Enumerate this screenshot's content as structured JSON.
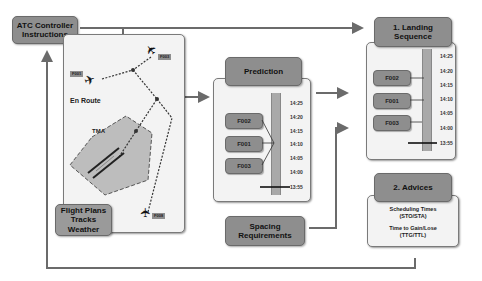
{
  "atc": {
    "line1": "ATC Controller",
    "line2": "Instructions"
  },
  "airspace": {
    "en_route_label": "En Route",
    "tma_label": "TMA",
    "flights": [
      "F001",
      "F003",
      "F008"
    ],
    "data_box": {
      "line1": "Flight Plans",
      "line2": "Tracks",
      "line3": "Weather"
    }
  },
  "prediction": {
    "title": "Prediction",
    "flights": [
      "F002",
      "F001",
      "F003"
    ],
    "times": [
      "14:25",
      "14:20",
      "14:15",
      "14:10",
      "14:05",
      "14:00",
      "13:55"
    ]
  },
  "spacing": {
    "line1": "Spacing",
    "line2": "Requirements"
  },
  "landing": {
    "title_line1": "1. Landing",
    "title_line2": "Sequence",
    "flights": [
      "F002",
      "F001",
      "F003"
    ],
    "times": [
      "14:25",
      "14:20",
      "14:15",
      "14:10",
      "14:05",
      "14:00",
      "13:55"
    ]
  },
  "advices": {
    "title": "2. Advices",
    "item1_line1": "Scheduling Times",
    "item1_line2": "(STO/STA)",
    "item2_line1": "Time to Gain/Lose",
    "item2_line2": "(TTG/TTL)"
  },
  "colors": {
    "box": "#8e8e8e",
    "panel": "#f3f3f3",
    "line": "#6b6b6b"
  }
}
